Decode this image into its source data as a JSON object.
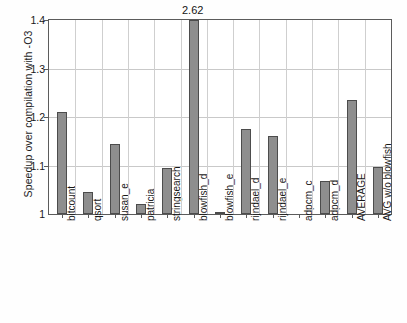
{
  "chart_data": {
    "type": "bar",
    "title": "",
    "xlabel": "",
    "ylabel": "Speedup over compilation with -O3",
    "ylim": [
      1.0,
      1.4
    ],
    "yticks": [
      1.0,
      1.1,
      1.2,
      1.3,
      1.4
    ],
    "ytick_labels": [
      "1",
      "1.1",
      "1.2",
      "1.3",
      "1.4"
    ],
    "grid": true,
    "legend": "none",
    "categories": [
      "bitcount",
      "qsort",
      "susan_e",
      "patricia",
      "stringsearch",
      "blowfish_d",
      "blowfish_e",
      "rijndael_d",
      "rijndael_e",
      "adpcm_c",
      "adpcm_d",
      "AVERAGE",
      "AVG w/o blowfish"
    ],
    "values": [
      1.21,
      1.045,
      1.145,
      1.02,
      1.095,
      2.62,
      1.005,
      1.175,
      1.16,
      1.0,
      1.068,
      1.235,
      1.096
    ],
    "annotations": [
      {
        "category": "blowfish_d",
        "text": "2.62",
        "note": "bar clipped at top of axis"
      }
    ],
    "bar_color": "#8e8e8e",
    "bar_edge_color": "#4c4c4c",
    "axis_color": "#5b5b5b",
    "grid_color": "#c9c9c9"
  }
}
